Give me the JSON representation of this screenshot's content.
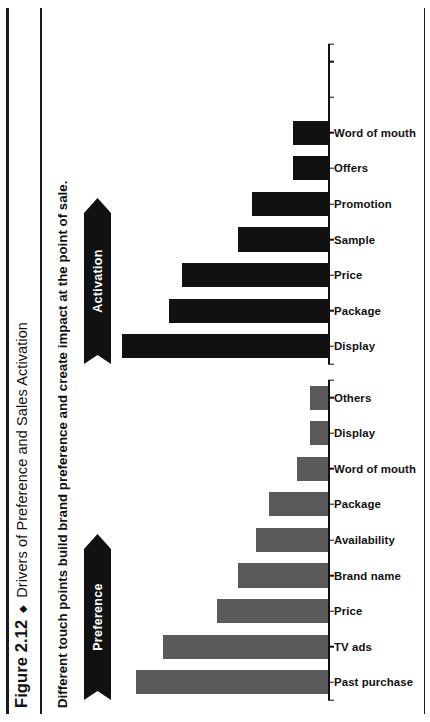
{
  "figure": {
    "number": "Figure 2.12",
    "diamond": "◆",
    "title": "Drivers of Preference and Sales Activation",
    "subtitle": "Different touch points build brand preference and create impact at the point of sale."
  },
  "panels": {
    "preference": {
      "banner_label": "Preference"
    },
    "activation": {
      "banner_label": "Activation"
    }
  },
  "colors": {
    "preference_bar": "#5a5a5a",
    "activation_bar": "#111111",
    "rule": "#1a1a1a",
    "banner_bg": "#111111",
    "banner_text": "#ffffff"
  },
  "chart_data": [
    {
      "type": "bar",
      "title": "Preference",
      "xlabel": "",
      "ylabel": "",
      "grid": false,
      "legend": "none",
      "ylim": [
        0,
        100
      ],
      "axis_slots": 9,
      "categories": [
        "Past purchase",
        "TV ads",
        "Price",
        "Brand name",
        "Availability",
        "Package",
        "Word of mouth",
        "Display",
        "Others"
      ],
      "values": [
        93,
        80,
        54,
        44,
        35,
        29,
        15,
        9,
        9
      ]
    },
    {
      "type": "bar",
      "title": "Activation",
      "xlabel": "",
      "ylabel": "",
      "grid": false,
      "legend": "none",
      "ylim": [
        0,
        100
      ],
      "axis_slots": 9,
      "categories": [
        "Display",
        "Package",
        "Price",
        "Sample",
        "Promotion",
        "Offers",
        "Word of mouth"
      ],
      "values": [
        100,
        77,
        71,
        44,
        37,
        17,
        17
      ]
    }
  ]
}
